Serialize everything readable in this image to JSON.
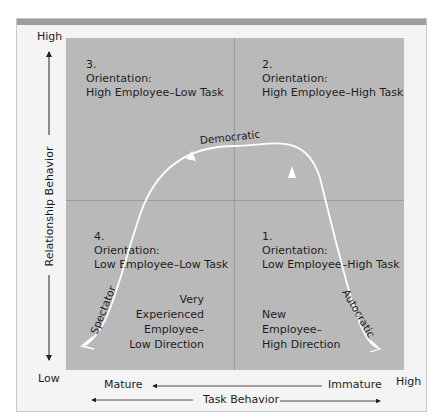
{
  "diagram": {
    "y_axis": {
      "title": "Relationship Behavior",
      "high": "High",
      "low": "Low"
    },
    "x_axis": {
      "title": "Task Behavior",
      "high": "High",
      "left_label": "Mature",
      "right_label": "Immature"
    },
    "quadrants": [
      {
        "id": 1,
        "number": "1.",
        "heading": "Orientation:",
        "orientation": "Low Employee–High Task",
        "note": [
          "New",
          "Employee–",
          "High Direction"
        ]
      },
      {
        "id": 2,
        "number": "2.",
        "heading": "Orientation:",
        "orientation": "High Employee–High Task"
      },
      {
        "id": 3,
        "number": "3.",
        "heading": "Orientation:",
        "orientation": "High Employee–Low Task"
      },
      {
        "id": 4,
        "number": "4.",
        "heading": "Orientation:",
        "orientation": "Low Employee–Low Task",
        "note": [
          "Very",
          "Experienced",
          "Employee–",
          "Low Direction"
        ]
      }
    ],
    "curve_labels": {
      "top": "Democratic",
      "right": "Autocratic",
      "left": "Spectator"
    },
    "colors": {
      "plot": "#b9b9b9",
      "curve": "#ffffff",
      "frame": "#f4f4f4"
    }
  }
}
